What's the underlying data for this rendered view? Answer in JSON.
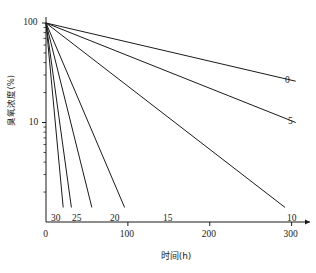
{
  "chart_data": {
    "type": "line",
    "title": "",
    "xlabel": "时间(h)",
    "ylabel": "臭氧浓度(%)",
    "xlim": [
      0,
      320
    ],
    "ylim": [
      1,
      100
    ],
    "yscale": "log",
    "xscale": "linear",
    "grid": false,
    "legend_position": "inline-end-labels",
    "x_ticks": [
      {
        "value": 0,
        "label": "0"
      },
      {
        "value": 100,
        "label": "100"
      },
      {
        "value": 200,
        "label": "200"
      },
      {
        "value": 300,
        "label": "300"
      }
    ],
    "y_ticks": [
      {
        "value": 100,
        "label": "100"
      },
      {
        "value": 10,
        "label": "10"
      }
    ],
    "y_minor_ticks": [
      90,
      80,
      70,
      60,
      50,
      40,
      30,
      20,
      9,
      8,
      7,
      6,
      5,
      4,
      3,
      2
    ],
    "series": [
      {
        "name": "0",
        "label": "0",
        "x": [
          0,
          305
        ],
        "values": [
          100,
          26.0
        ]
      },
      {
        "name": "5",
        "label": "5",
        "x": [
          0,
          305
        ],
        "values": [
          100,
          10.0
        ]
      },
      {
        "name": "10",
        "label": "10",
        "x": [
          0,
          292
        ],
        "values": [
          100,
          1.4
        ]
      },
      {
        "name": "15",
        "label": "15",
        "x": [
          0,
          96
        ],
        "values": [
          100,
          1.4
        ]
      },
      {
        "name": "20",
        "label": "20",
        "x": [
          0,
          56
        ],
        "values": [
          100,
          1.4
        ]
      },
      {
        "name": "25",
        "label": "25",
        "x": [
          0,
          31
        ],
        "values": [
          100,
          1.4
        ]
      },
      {
        "name": "30",
        "label": "30",
        "x": [
          0,
          21
        ],
        "values": [
          100,
          1.4
        ]
      }
    ],
    "series_label_positions": [
      {
        "name": "0",
        "label": "0",
        "x_px": 285,
        "y_px": 76
      },
      {
        "name": "5",
        "label": "5",
        "x_px": 288,
        "y_px": 117
      },
      {
        "name": "10",
        "label": "10",
        "x_px": 287,
        "y_px": 214
      },
      {
        "name": "15",
        "label": "15",
        "x_px": 163,
        "y_px": 214
      },
      {
        "name": "20",
        "label": "20",
        "x_px": 110,
        "y_px": 214
      },
      {
        "name": "25",
        "label": "25",
        "x_px": 72,
        "y_px": 214
      },
      {
        "name": "30",
        "label": "30",
        "x_px": 51,
        "y_px": 214
      }
    ],
    "colors": {
      "line": "#1a1a1a",
      "axis": "#1a1a1a",
      "background": "#ffffff"
    }
  },
  "axes": {
    "x_tick_labels": [
      "0",
      "100",
      "200",
      "300"
    ],
    "y_tick_labels": [
      "100",
      "10"
    ],
    "x_title": "时间(h)",
    "y_title": "臭氧浓度(%)"
  }
}
